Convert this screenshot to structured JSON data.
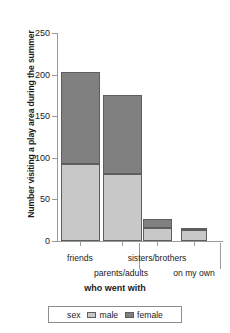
{
  "chart_data": {
    "type": "bar",
    "subtype": "stacked-bar",
    "title": "",
    "xlabel": "who went with",
    "ylabel": "Number visiting a play area during the summer",
    "categories": [
      "friends",
      "parents/adults",
      "sisters/brothers",
      "on my own"
    ],
    "series": [
      {
        "name": "male",
        "color": "#c8c8c8",
        "values": [
          93,
          81,
          16,
          13
        ]
      },
      {
        "name": "female",
        "color": "#808080",
        "values": [
          110,
          95,
          11,
          3
        ]
      }
    ],
    "totals": [
      203,
      176,
      27,
      16
    ],
    "ylim": [
      0,
      260
    ],
    "yticks": [
      0,
      50,
      100,
      150,
      200,
      250
    ],
    "ytick_labels": [
      "0",
      "50",
      "100",
      "150",
      "200",
      "250"
    ],
    "grid": false,
    "legend": {
      "title": "sex",
      "position": "bottom",
      "entries": [
        {
          "label": "male",
          "color": "#c8c8c8"
        },
        {
          "label": "female",
          "color": "#808080"
        }
      ]
    }
  }
}
